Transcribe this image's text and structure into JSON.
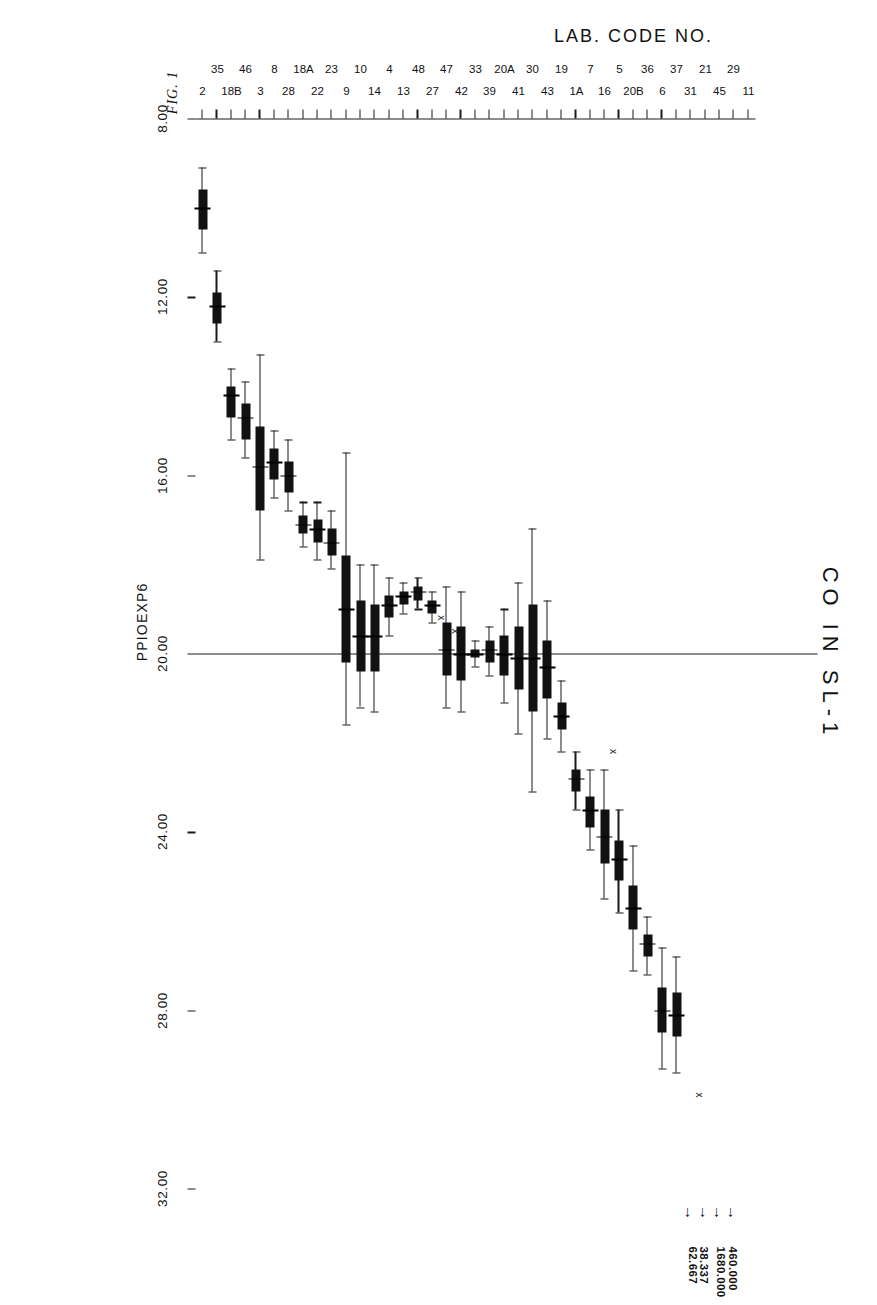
{
  "chart_data": {
    "type": "box",
    "title": "CO  IN  SL-1",
    "figure_number": "FIG. 1",
    "xlabel": "LAB. CODE NO.",
    "ylabel": "PPIOEXP6",
    "ylim": [
      8.0,
      32.0
    ],
    "yticks": [
      "8.00",
      "12.00",
      "16.00",
      "20.00",
      "24.00",
      "28.00",
      "32.00"
    ],
    "ytick_values": [
      8,
      12,
      16,
      20,
      24,
      28,
      32
    ],
    "grid": false,
    "legend": "none",
    "reference_line": 20.0,
    "categories": [
      "2",
      "35",
      "18B",
      "46",
      "3",
      "8",
      "28",
      "18A",
      "22",
      "23",
      "9",
      "10",
      "14",
      "4",
      "13",
      "48",
      "27",
      "47",
      "42",
      "33",
      "39",
      "20A",
      "41",
      "30",
      "43",
      "19",
      "1A",
      "7",
      "16",
      "5",
      "20B",
      "36",
      "6",
      "37",
      "31",
      "21",
      "45",
      "29",
      "11"
    ],
    "boxes": [
      {
        "code": "2",
        "low": 9.1,
        "q1": 9.6,
        "median": 10.0,
        "q3": 10.5,
        "high": 11.0
      },
      {
        "code": "35",
        "low": 11.4,
        "q1": 11.9,
        "median": 12.2,
        "q3": 12.6,
        "high": 13.0
      },
      {
        "code": "18B",
        "low": 13.6,
        "q1": 14.0,
        "median": 14.2,
        "q3": 14.7,
        "high": 15.2
      },
      {
        "code": "46",
        "low": 13.9,
        "q1": 14.4,
        "median": 14.7,
        "q3": 15.2,
        "high": 15.6
      },
      {
        "code": "3",
        "low": 13.3,
        "q1": 14.9,
        "median": 15.8,
        "q3": 16.8,
        "high": 17.9
      },
      {
        "code": "8",
        "low": 15.0,
        "q1": 15.4,
        "median": 15.7,
        "q3": 16.1,
        "high": 16.5
      },
      {
        "code": "28",
        "low": 15.2,
        "q1": 15.7,
        "median": 16.0,
        "q3": 16.4,
        "high": 16.8
      },
      {
        "code": "18A",
        "low": 16.6,
        "q1": 16.9,
        "median": 17.1,
        "q3": 17.3,
        "high": 17.6
      },
      {
        "code": "22",
        "low": 16.6,
        "q1": 17.0,
        "median": 17.2,
        "q3": 17.5,
        "high": 17.9
      },
      {
        "code": "23",
        "low": 16.8,
        "q1": 17.2,
        "median": 17.5,
        "q3": 17.8,
        "high": 18.1
      },
      {
        "code": "9",
        "low": 15.5,
        "q1": 17.8,
        "median": 19.0,
        "q3": 20.2,
        "high": 21.6
      },
      {
        "code": "10",
        "low": 18.0,
        "q1": 18.8,
        "median": 19.6,
        "q3": 20.4,
        "high": 21.2
      },
      {
        "code": "14",
        "low": 18.0,
        "q1": 18.9,
        "median": 19.6,
        "q3": 20.4,
        "high": 21.3
      },
      {
        "code": "4",
        "low": 18.3,
        "q1": 18.7,
        "median": 18.9,
        "q3": 19.2,
        "high": 19.6
      },
      {
        "code": "13",
        "low": 18.4,
        "q1": 18.6,
        "median": 18.7,
        "q3": 18.9,
        "high": 19.1
      },
      {
        "code": "48",
        "low": 18.3,
        "q1": 18.5,
        "median": 18.6,
        "q3": 18.8,
        "high": 19.0
      },
      {
        "code": "27",
        "low": 18.6,
        "q1": 18.8,
        "median": 18.9,
        "q3": 19.1,
        "high": 19.3
      },
      {
        "code": "47",
        "low": 18.5,
        "q1": 19.3,
        "median": 19.9,
        "q3": 20.5,
        "high": 21.2
      },
      {
        "code": "42",
        "low": 18.6,
        "q1": 19.4,
        "median": 20.0,
        "q3": 20.6,
        "high": 21.3
      },
      {
        "code": "33",
        "low": 19.7,
        "q1": 19.9,
        "median": 20.0,
        "q3": 20.1,
        "high": 20.3
      },
      {
        "code": "39",
        "low": 19.4,
        "q1": 19.7,
        "median": 19.9,
        "q3": 20.2,
        "high": 20.5
      },
      {
        "code": "20A",
        "low": 19.0,
        "q1": 19.6,
        "median": 20.0,
        "q3": 20.5,
        "high": 21.1
      },
      {
        "code": "41",
        "low": 18.4,
        "q1": 19.4,
        "median": 20.1,
        "q3": 20.8,
        "high": 21.8
      },
      {
        "code": "30",
        "low": 17.2,
        "q1": 18.9,
        "median": 20.1,
        "q3": 21.3,
        "high": 23.1
      },
      {
        "code": "43",
        "low": 18.8,
        "q1": 19.7,
        "median": 20.3,
        "q3": 21.0,
        "high": 21.9
      },
      {
        "code": "19",
        "low": 20.6,
        "q1": 21.1,
        "median": 21.4,
        "q3": 21.7,
        "high": 22.2
      },
      {
        "code": "1A",
        "low": 22.2,
        "q1": 22.6,
        "median": 22.8,
        "q3": 23.1,
        "high": 23.5
      },
      {
        "code": "7",
        "low": 22.6,
        "q1": 23.2,
        "median": 23.5,
        "q3": 23.9,
        "high": 24.4
      },
      {
        "code": "16",
        "low": 22.6,
        "q1": 23.5,
        "median": 24.1,
        "q3": 24.7,
        "high": 25.5
      },
      {
        "code": "5",
        "low": 23.5,
        "q1": 24.2,
        "median": 24.6,
        "q3": 25.1,
        "high": 25.8
      },
      {
        "code": "20B",
        "low": 24.3,
        "q1": 25.2,
        "median": 25.7,
        "q3": 26.2,
        "high": 27.1
      },
      {
        "code": "36",
        "low": 25.9,
        "q1": 26.3,
        "median": 26.5,
        "q3": 26.8,
        "high": 27.2
      },
      {
        "code": "6",
        "low": 26.6,
        "q1": 27.5,
        "median": 28.0,
        "q3": 28.5,
        "high": 29.3
      },
      {
        "code": "37",
        "low": 26.8,
        "q1": 27.6,
        "median": 28.1,
        "q3": 28.6,
        "high": 29.4
      }
    ],
    "outliers": [
      {
        "code": "37",
        "value": 29.9
      },
      {
        "code": "7",
        "value": 22.2
      },
      {
        "code": "48",
        "value": 19.2
      },
      {
        "code": "27",
        "value": 19.5
      }
    ],
    "offscale_annotations": [
      {
        "code": "31",
        "value": "38.337"
      },
      {
        "code": "21",
        "value": "62.667"
      },
      {
        "code": "45",
        "value": "460.000"
      },
      {
        "code": "29",
        "value": "1680.000"
      }
    ]
  }
}
